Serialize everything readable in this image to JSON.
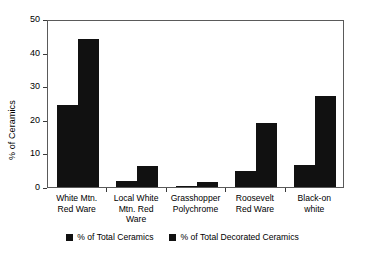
{
  "chart_data": {
    "type": "bar",
    "title": "",
    "xlabel": "",
    "ylabel": "% of Ceramics",
    "ylim": [
      0,
      50
    ],
    "yticks": [
      0,
      10,
      20,
      30,
      40,
      50
    ],
    "ytick_labels": [
      "0",
      "10",
      "20",
      "30",
      "40",
      "50"
    ],
    "grid": false,
    "legend_position": "bottom",
    "categories": [
      "White Mtn.\nRed Ware",
      "Local White\nMtn. Red\nWare",
      "Grasshopper\nPolychrome",
      "Roosevelt\nRed Ware",
      "Black-on\nwhite"
    ],
    "series": [
      {
        "name": "% of Total Ceramics",
        "color": "#111111",
        "values": [
          24.5,
          1.7,
          0.4,
          4.9,
          6.7
        ]
      },
      {
        "name": "% of Total Decorated Ceramics",
        "color": "#111111",
        "values": [
          44.2,
          6.2,
          1.6,
          19.2,
          27.2
        ]
      }
    ]
  },
  "axis": {
    "frame_color": "#5a5a5a"
  }
}
